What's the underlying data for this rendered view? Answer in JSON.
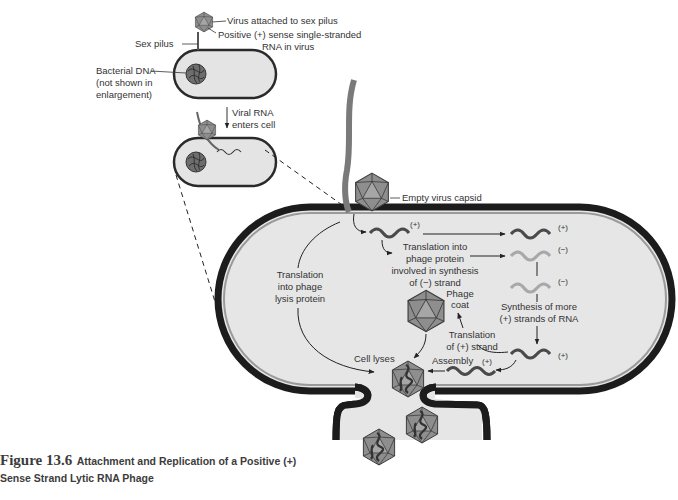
{
  "figure": {
    "number": "Figure 13.6",
    "title_line1": "Attachment and Replication of a Positive (+)",
    "title_line2": "Sense Strand Lytic RNA Phage"
  },
  "top_panel": {
    "virus_attached": "Virus attached to sex pilus",
    "sex_pilus": "Sex pilus",
    "positive_rna_line1": "Positive (+) sense single-stranded",
    "positive_rna_line2": "RNA in virus",
    "bacterial_dna_line1": "Bacterial DNA",
    "bacterial_dna_line2": "(not shown in",
    "bacterial_dna_line3": "enlargement)",
    "viral_rna_line1": "Viral RNA",
    "viral_rna_line2": "enters cell"
  },
  "enlargement": {
    "empty_capsid": "Empty virus capsid",
    "plus_top": "(+)",
    "plus_right_1": "(+)",
    "minus_right_1": "(−)",
    "minus_right_2": "(−)",
    "plus_right_2": "(+)",
    "plus_assembly": "(+)",
    "translation_phage_line1": "Translation into",
    "translation_phage_line2": "phage protein",
    "translation_phage_line3": "involved in synthesis",
    "translation_phage_line4": "of (−) strand",
    "lysis_line1": "Translation",
    "lysis_line2": "into phage",
    "lysis_line3": "lysis protein",
    "synthesis_line1": "Synthesis of more",
    "synthesis_line2": "(+) strands of RNA",
    "phage_coat_line1": "Phage",
    "phage_coat_line2": "coat",
    "translation_plus_line1": "Translation",
    "translation_plus_line2": "of (+) strand",
    "assembly": "Assembly",
    "cell_lyses": "Cell lyses"
  },
  "colors": {
    "cell_fill": "#e6e6e6",
    "cell_wall": "#1c1c1c",
    "cell_wall_inner": "#8a8a8a",
    "plus_strand": "#4a4a4a",
    "minus_strand": "#a8a8a8",
    "pilus": "#7a7a7a",
    "capsid": "#8c8c8c"
  }
}
